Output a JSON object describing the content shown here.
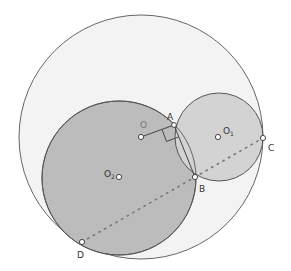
{
  "colors": {
    "background": "#ffffff",
    "outer_fill": "#f3f3f3",
    "big_fill": "#bcbcbc",
    "small_fill": "#d3d3d3",
    "stroke": "#555555",
    "point_fill": "#ffffff"
  },
  "circles": {
    "outer": {
      "label": "O",
      "cx": 141,
      "cy": 137,
      "r": 122
    },
    "small": {
      "label": "O1",
      "cx": 219,
      "cy": 137,
      "r": 44
    },
    "big": {
      "label": "O2",
      "cx": 119,
      "cy": 178,
      "r": 77
    }
  },
  "points": {
    "A": {
      "label": "A",
      "x": 174,
      "y": 125
    },
    "B": {
      "label": "B",
      "x": 195,
      "y": 177
    },
    "C": {
      "label": "C",
      "x": 263,
      "y": 138
    },
    "D": {
      "label": "D",
      "x": 82,
      "y": 242
    },
    "O": {
      "label": "O",
      "x": 141,
      "y": 137
    },
    "O1": {
      "label": "O",
      "sub": "1",
      "x": 219,
      "y": 137
    },
    "O2": {
      "label": "O",
      "sub": "2",
      "x": 119,
      "y": 177
    }
  },
  "labels": {
    "A": "A",
    "B": "B",
    "C": "C",
    "D": "D",
    "O": "O",
    "O1_main": "O",
    "O1_sub": "1",
    "O2_main": "O",
    "O2_sub": "2"
  }
}
